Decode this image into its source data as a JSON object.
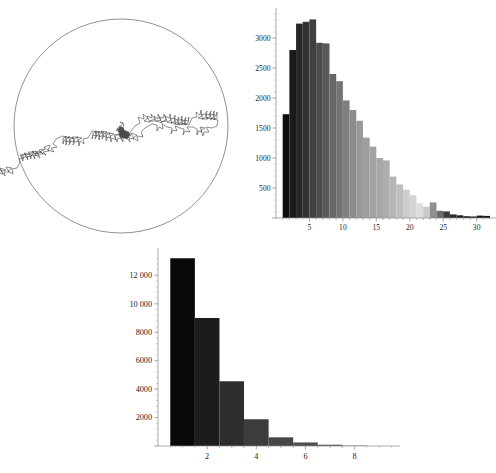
{
  "figure": {
    "title": "",
    "panels": [
      "random-walk-in-disk",
      "exit-time-histogram",
      "step-count-histogram"
    ]
  },
  "panel_walk": {
    "name": "Random walk inside a circular disk",
    "circle": {
      "cx": 121,
      "cy": 126,
      "r": 107,
      "stroke": "#6e6e6e"
    },
    "path_stroke": "#4a4a4a",
    "start_point": [
      121,
      126
    ]
  },
  "chart_data": [
    {
      "id": "exit-time-histogram",
      "type": "bar",
      "title": "",
      "xlabel": "",
      "ylabel": "",
      "xlim": [
        0,
        32
      ],
      "ylim": [
        0,
        3400
      ],
      "grid": false,
      "legend": null,
      "bin_width": 1,
      "xticks": [
        5,
        10,
        15,
        20,
        25,
        30
      ],
      "xticklabels": [
        "5",
        "10",
        "15",
        "20",
        "25",
        "30"
      ],
      "yticks": [
        500,
        1000,
        1500,
        2000,
        2500,
        3000
      ],
      "yticklabels": [
        "500",
        "1000",
        "1500",
        "2000",
        "2500",
        "3000"
      ],
      "bin_starts": [
        1,
        2,
        3,
        4,
        5,
        6,
        7,
        8,
        9,
        10,
        11,
        12,
        13,
        14,
        15,
        16,
        17,
        18,
        19,
        20,
        21,
        22,
        23,
        24,
        25,
        26,
        27,
        28,
        29,
        30,
        31
      ],
      "values": [
        1730,
        2800,
        3240,
        3270,
        3310,
        2920,
        2910,
        2400,
        2280,
        1960,
        1800,
        1620,
        1340,
        1190,
        1000,
        960,
        690,
        560,
        470,
        380,
        250,
        190,
        260,
        120,
        110,
        60,
        45,
        30,
        25,
        40,
        35
      ],
      "bar_colors": [
        "#0d0d0d",
        "#1a1a1a",
        "#262626",
        "#333333",
        "#404040",
        "#4d4d4d",
        "#5a5a5a",
        "#666666",
        "#737373",
        "#808080",
        "#8c8c8c",
        "#999999",
        "#9e9e9e",
        "#a3a3a3",
        "#a8a8a8",
        "#adadad",
        "#b5b5b5",
        "#bfbfbf",
        "#cccccc",
        "#d4d4d4",
        "#dedede",
        "#c9c9c9",
        "#8f8f8f",
        "#6b6b6b",
        "#3a3a3a",
        "#2b2b2b",
        "#222222",
        "#1d1d1d",
        "#1a1a1a",
        "#181818",
        "#161616"
      ]
    },
    {
      "id": "step-count-histogram",
      "type": "bar",
      "title": "",
      "xlabel": "",
      "ylabel": "",
      "xlim": [
        0,
        9.6
      ],
      "ylim": [
        0,
        13500
      ],
      "grid": false,
      "legend": null,
      "bin_width": 1,
      "xticks": [
        2,
        4,
        6,
        8
      ],
      "xticklabels": [
        "2",
        "4",
        "6",
        "8"
      ],
      "yticks": [
        2000,
        4000,
        6000,
        8000,
        10000,
        12000
      ],
      "yticklabels": [
        "2000",
        "4000",
        "6000",
        "8000",
        "10 000",
        "12 000"
      ],
      "bin_starts": [
        0.5,
        1.5,
        2.5,
        3.5,
        4.5,
        5.5,
        6.5,
        7.5
      ],
      "values": [
        13200,
        9000,
        4550,
        1880,
        610,
        250,
        90,
        25
      ],
      "bar_colors": [
        "#080808",
        "#1c1c1c",
        "#2e2e2e",
        "#3c3c3c",
        "#474747",
        "#4f4f4f",
        "#575757",
        "#5e5e5e"
      ]
    }
  ]
}
